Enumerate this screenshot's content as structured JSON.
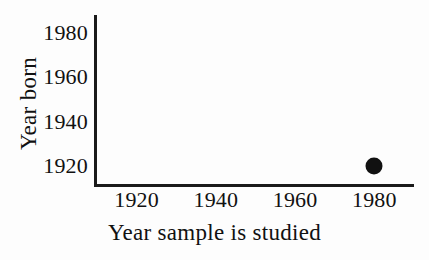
{
  "chart_data": {
    "type": "scatter",
    "title": "",
    "xlabel": "Year sample is studied",
    "ylabel": "Year born",
    "xlim": [
      1910,
      1990
    ],
    "ylim": [
      1912,
      1988
    ],
    "xticks": [
      1920,
      1940,
      1960,
      1980
    ],
    "xticklabels": [
      "1920",
      "1940",
      "1960",
      "1980"
    ],
    "yticks": [
      1920,
      1940,
      1960,
      1980
    ],
    "yticklabels": [
      "1920",
      "1940",
      "1960",
      "1980"
    ],
    "grid": false,
    "legend": null,
    "series": [
      {
        "name": "sample",
        "marker": "filled-circle",
        "color": "#111111",
        "points": [
          {
            "x": 1980,
            "y": 1920
          }
        ]
      }
    ],
    "annotations": []
  },
  "figure": {
    "background_color": "#fdfdfd",
    "axis_color": "#1a1a1a",
    "text_color": "#111111"
  }
}
